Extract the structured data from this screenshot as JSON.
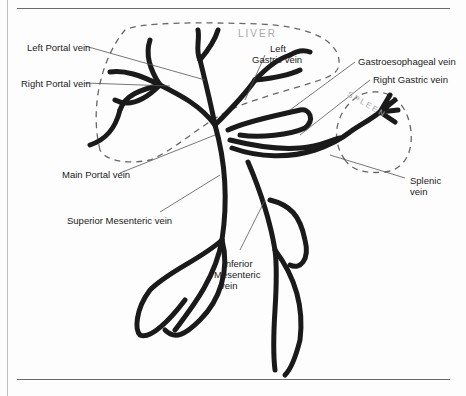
{
  "diagram": {
    "organs": {
      "liver": "LIVER",
      "spleen": "SPLEEN"
    },
    "labels": {
      "left_portal_vein": "Left Portal vein",
      "right_portal_vein": "Right Portal vein",
      "left_gastric_vein_line1": "Left",
      "left_gastric_vein_line2": "Gastric vein",
      "gastroesophageal_vein": "Gastroesophageal vein",
      "right_gastric_vein": "Right Gastric vein",
      "main_portal_vein": "Main Portal vein",
      "splenic_vein_line1": "Splenic",
      "splenic_vein_line2": "vein",
      "superior_mesenteric_vein": "Superior Mesenteric vein",
      "inferior_mesenteric_vein_line1": "Inferior",
      "inferior_mesenteric_vein_line2": "Mesenteric",
      "inferior_mesenteric_vein_line3": "vein"
    },
    "colors": {
      "vessel_stroke": "#1a1a1a",
      "organ_outline": "#555555",
      "leader_line": "#555555",
      "organ_label": "#a8a8a8"
    }
  }
}
